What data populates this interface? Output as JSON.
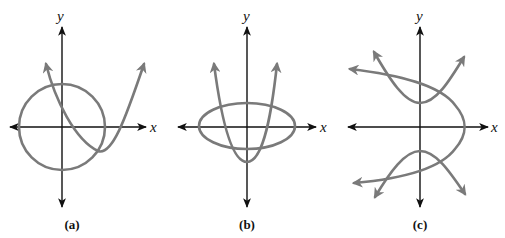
{
  "figure": {
    "panels": [
      {
        "id": "a",
        "label": "(a)",
        "x_axis_label": "x",
        "y_axis_label": "y",
        "curves": [
          "circle centered at origin",
          "upward-opening parabola with vertex in fourth quadrant"
        ]
      },
      {
        "id": "b",
        "label": "(b)",
        "x_axis_label": "x",
        "y_axis_label": "y",
        "curves": [
          "horizontal ellipse centered at origin",
          "upward-opening parabola with vertex on negative y-axis"
        ]
      },
      {
        "id": "c",
        "label": "(c)",
        "x_axis_label": "x",
        "y_axis_label": "y",
        "curves": [
          "left-opening parabola with vertex on positive x-axis",
          "vertical hyperbola centered at origin"
        ]
      }
    ],
    "colors": {
      "curve": "#7a7a7a",
      "axis": "#111111",
      "background": "#ffffff"
    }
  }
}
